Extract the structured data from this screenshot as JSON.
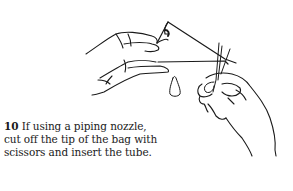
{
  "step": {
    "number": "10",
    "text": " If using a piping nozzle, cut off the tip of the bag with scissors and insert the tube."
  },
  "illustration": {
    "description": "hands-cutting-piping-bag-tip-with-scissors",
    "stroke_color": "#1a1a1a"
  }
}
